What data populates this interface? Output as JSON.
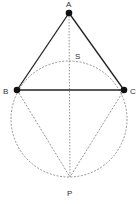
{
  "diagram": {
    "type": "geometry",
    "colors": {
      "solid_line": "#222222",
      "dashed_line": "#777777",
      "point": "#111111",
      "label": "#333333"
    },
    "points": {
      "A": {
        "label": "A",
        "x": 69,
        "y": 13
      },
      "B": {
        "label": "B",
        "x": 17,
        "y": 90
      },
      "C": {
        "label": "C",
        "x": 124,
        "y": 90
      },
      "P": {
        "label": "P",
        "x": 70,
        "y": 177
      },
      "S": {
        "label": "S",
        "x": 69,
        "y": 61
      }
    },
    "circle": {
      "cx": 69,
      "cy": 119,
      "r": 58,
      "style": "dashed"
    },
    "segments": [
      {
        "from": "A",
        "to": "B",
        "style": "solid"
      },
      {
        "from": "A",
        "to": "C",
        "style": "solid"
      },
      {
        "from": "B",
        "to": "C",
        "style": "solid"
      },
      {
        "from": "A",
        "to": "P",
        "style": "dotted"
      },
      {
        "from": "B",
        "to": "P",
        "style": "dashed"
      },
      {
        "from": "C",
        "to": "P",
        "style": "dashed"
      }
    ]
  }
}
